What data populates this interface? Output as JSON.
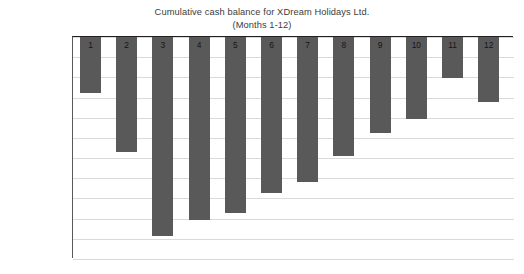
{
  "chart_data": {
    "type": "bar",
    "title": "Cumulative cash balance for XDream Holidays Ltd.",
    "subtitle": "(Months 1-12)",
    "xlabel": "",
    "ylabel": "",
    "categories": [
      "1",
      "2",
      "3",
      "4",
      "5",
      "6",
      "7",
      "8",
      "9",
      "10",
      "11",
      "12"
    ],
    "values": [
      -55000,
      -114000,
      -217000,
      -201000,
      -194000,
      -169000,
      -148000,
      -118000,
      -95000,
      -81000,
      -41000,
      -64000
    ],
    "ylim": [
      -240000,
      0
    ],
    "grid": true,
    "legend_position": "none",
    "bar_color": "#595959",
    "gridline_color": "#d9dadb",
    "axis_color": "#58595b",
    "ytick_labels": [
      "£0",
      "–£20,000",
      "–£40,000",
      "–£60,000",
      "–£80,000",
      "–£100,000",
      "–£120,000",
      "–£140,000",
      "–£180,000",
      "–£200,000",
      "–£220,000",
      "–£240,000"
    ],
    "ytick_values": [
      0,
      -20000,
      -40000,
      -60000,
      -80000,
      -100000,
      -120000,
      -140000,
      -180000,
      -200000,
      -220000,
      -240000
    ]
  }
}
